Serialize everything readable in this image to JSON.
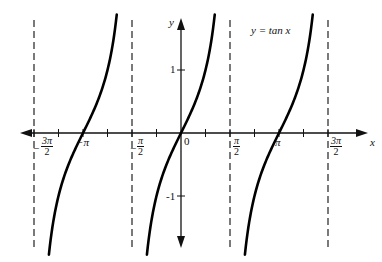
{
  "chart_data": {
    "type": "line",
    "title": "y = tan x",
    "xlabel": "x",
    "ylabel": "y",
    "function": "tan(x)",
    "x_range": [
      -4.9,
      5.1
    ],
    "ylim": [
      -1.95,
      1.85
    ],
    "asymptotes": [
      "-3π/2",
      "-π/2",
      "π/2",
      "3π/2"
    ],
    "x_tick_labels": [
      "-3π/2",
      "-π",
      "-π/2",
      "0",
      "π/2",
      "π",
      "3π/2"
    ],
    "y_tick_labels": [
      "1",
      "-1"
    ],
    "x_tick_step": "π/4",
    "series": [
      {
        "name": "branch (-3π/2, -π/2)",
        "x": [
          -4.5,
          -3.93,
          -3.5,
          -3.14,
          -2.78,
          -2.36,
          -1.8
        ],
        "y": [
          -1.93,
          -1.0,
          -0.37,
          0,
          0.37,
          1.0,
          1.88
        ]
      },
      {
        "name": "branch (-π/2, π/2)",
        "x": [
          -1.09,
          -0.785,
          -0.4,
          0,
          0.4,
          0.785,
          1.09
        ],
        "y": [
          -1.93,
          -1.0,
          -0.42,
          0,
          0.42,
          1.0,
          1.88
        ]
      },
      {
        "name": "branch (π/2, 3π/2)",
        "x": [
          2.05,
          2.36,
          2.74,
          3.14,
          3.54,
          3.93,
          4.23
        ],
        "y": [
          -1.93,
          -1.0,
          -0.42,
          0,
          0.42,
          1.0,
          1.88
        ]
      }
    ],
    "grid": false,
    "legend": "annotation top-right: y = tan x"
  },
  "labels": {
    "title": "y = tan x",
    "x_axis": "x",
    "y_axis": "y",
    "y_pos1": "1",
    "y_neg1": "-1",
    "zero": "0",
    "neg_pi": "−π",
    "pi": "π",
    "neg_3pi2_num": "3π",
    "neg_3pi2_den": "2",
    "neg_pi2_num": "π",
    "neg_pi2_den": "2",
    "pi2_num": "π",
    "pi2_den": "2",
    "pi32_num": "3π",
    "pi32_den": "2",
    "minus": "−"
  }
}
